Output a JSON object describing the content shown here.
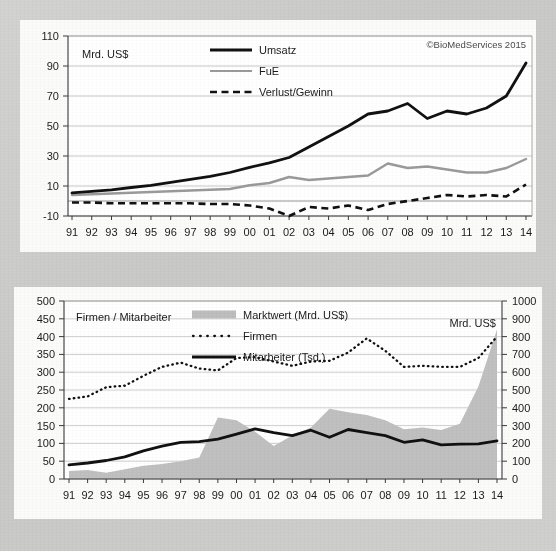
{
  "credit": "©BioMedServices 2015",
  "charts": {
    "top": {
      "axis_note": "Mrd. US$",
      "legend": [
        {
          "key": "umsatz",
          "label": "Umsatz",
          "style": "solid-thick-black",
          "color": "#111111"
        },
        {
          "key": "fue",
          "label": "FuE",
          "style": "solid-gray",
          "color": "#9a9a9a"
        },
        {
          "key": "verlust_gewinn",
          "label": "Verlust/Gewinn",
          "style": "dashed-black",
          "color": "#111111"
        }
      ]
    },
    "bottom": {
      "axis_note_left": "Firmen / Mitarbeiter",
      "axis_note_right": "Mrd. US$",
      "legend": [
        {
          "key": "marktwert",
          "label": "Marktwert (Mrd. US$)",
          "style": "area-gray",
          "color": "#bdbdbd"
        },
        {
          "key": "firmen",
          "label": "Firmen",
          "style": "dotted-black",
          "color": "#111111"
        },
        {
          "key": "mitarbeiter",
          "label": "Mitarbeiter (Tsd.)",
          "style": "solid-thick-black",
          "color": "#111111"
        }
      ]
    }
  },
  "chart_data": [
    {
      "type": "line",
      "id": "top",
      "title": "",
      "xlabel": "",
      "ylabel": "Mrd. US$",
      "grid": true,
      "legend_position": "inside-top-center",
      "annotations": [
        "©BioMedServices 2015"
      ],
      "categories": [
        "91",
        "92",
        "93",
        "94",
        "95",
        "96",
        "97",
        "98",
        "99",
        "00",
        "01",
        "02",
        "03",
        "04",
        "05",
        "06",
        "07",
        "08",
        "09",
        "10",
        "11",
        "12",
        "13",
        "14"
      ],
      "yticks": [
        -10,
        10,
        30,
        50,
        70,
        90,
        110
      ],
      "ylim": [
        -10,
        110
      ],
      "series": [
        {
          "name": "Umsatz",
          "values": [
            5.5,
            6.5,
            7.5,
            9,
            10.5,
            12.5,
            14.5,
            16.5,
            19,
            22.5,
            25.5,
            29,
            36,
            43,
            50,
            58,
            60,
            65,
            55,
            60,
            58,
            62,
            70,
            92
          ]
        },
        {
          "name": "FuE",
          "values": [
            4,
            4.5,
            5,
            5.5,
            6,
            6.5,
            7,
            7.5,
            8,
            10.5,
            12,
            16,
            14,
            15,
            16,
            17,
            25,
            22,
            23,
            21,
            19,
            19,
            22,
            28
          ]
        },
        {
          "name": "Verlust/Gewinn",
          "values": [
            -1,
            -1,
            -1.5,
            -1.5,
            -1.5,
            -1.5,
            -1.5,
            -2,
            -2,
            -3,
            -5,
            -10,
            -4,
            -5,
            -3,
            -6,
            -2,
            0,
            2,
            4,
            3,
            4,
            3,
            11
          ]
        }
      ]
    },
    {
      "type": "area-line",
      "id": "bottom",
      "title": "",
      "xlabel": "",
      "ylabel_left": "Firmen / Mitarbeiter",
      "ylabel_right": "Mrd. US$",
      "grid": true,
      "legend_position": "inside-top-center",
      "categories": [
        "91",
        "92",
        "93",
        "94",
        "95",
        "96",
        "97",
        "98",
        "99",
        "00",
        "01",
        "02",
        "03",
        "04",
        "05",
        "06",
        "07",
        "08",
        "09",
        "10",
        "11",
        "12",
        "13",
        "14"
      ],
      "yticks_left": [
        0,
        50,
        100,
        150,
        200,
        250,
        300,
        350,
        400,
        450,
        500
      ],
      "ylim_left": [
        0,
        500
      ],
      "yticks_right": [
        0,
        100,
        200,
        300,
        400,
        500,
        600,
        700,
        800,
        900,
        1000
      ],
      "ylim_right": [
        0,
        1000
      ],
      "series": [
        {
          "name": "Marktwert (Mrd. US$)",
          "axis": "right",
          "kind": "area",
          "values": [
            45,
            50,
            35,
            55,
            75,
            85,
            100,
            120,
            345,
            330,
            265,
            185,
            245,
            290,
            395,
            375,
            360,
            330,
            280,
            290,
            275,
            310,
            520,
            840
          ]
        },
        {
          "name": "Firmen",
          "axis": "left",
          "kind": "dotted",
          "values": [
            225,
            232,
            258,
            262,
            290,
            315,
            327,
            310,
            305,
            340,
            342,
            330,
            318,
            330,
            332,
            355,
            395,
            360,
            315,
            318,
            315,
            315,
            340,
            400
          ]
        },
        {
          "name": "Mitarbeiter (Tsd.)",
          "axis": "left",
          "kind": "line",
          "values": [
            40,
            45,
            52,
            62,
            79,
            92,
            103,
            105,
            112,
            126,
            141,
            130,
            122,
            137,
            117,
            139,
            130,
            122,
            103,
            110,
            96,
            98,
            99,
            107
          ]
        }
      ]
    }
  ]
}
